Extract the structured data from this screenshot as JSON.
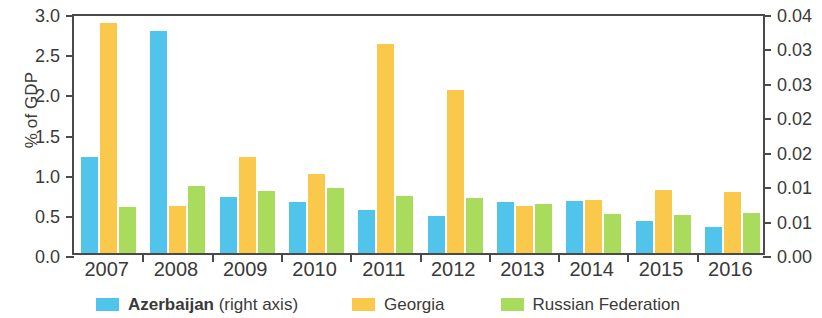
{
  "chart_data": {
    "type": "bar",
    "title": "",
    "subtitle": "",
    "xlabel": "",
    "ylabel": "% of GDP",
    "ylabel_right": "",
    "categories": [
      "2007",
      "2008",
      "2009",
      "2010",
      "2011",
      "2012",
      "2013",
      "2014",
      "2015",
      "2016"
    ],
    "series": [
      {
        "name": "Azerbaijan",
        "legend_note": "(right axis)",
        "axis": "right",
        "color": "#51c4ec",
        "values": [
          0.015,
          0.0345,
          0.0087,
          0.0079,
          0.0068,
          0.0057,
          0.008,
          0.0081,
          0.005,
          0.0041
        ],
        "left_axis_equivalent": [
          1.2,
          2.76,
          0.7,
          0.63,
          0.54,
          0.46,
          0.64,
          0.65,
          0.4,
          0.33
        ]
      },
      {
        "name": "Georgia",
        "legend_note": "",
        "axis": "left",
        "color": "#fac94b",
        "values": [
          2.86,
          0.58,
          1.2,
          0.98,
          2.6,
          2.03,
          0.59,
          0.66,
          0.78,
          0.76
        ]
      },
      {
        "name": "Russian Federation",
        "legend_note": "",
        "axis": "left",
        "color": "#a9dc5c",
        "values": [
          0.57,
          0.84,
          0.77,
          0.81,
          0.71,
          0.69,
          0.61,
          0.49,
          0.47,
          0.5
        ]
      }
    ],
    "ylim": [
      0.0,
      3.0
    ],
    "ylim_right": [
      0.0,
      0.04
    ],
    "yticks_left": [
      "0.0",
      "0.5",
      "1.0",
      "1.5",
      "2.0",
      "2.5",
      "3.0"
    ],
    "yticks_left_values": [
      0.0,
      0.5,
      1.0,
      1.5,
      2.0,
      2.5,
      3.0
    ],
    "yticks_right": [
      "0.00",
      "0.01",
      "0.01",
      "0.02",
      "0.02",
      "0.03",
      "0.03",
      "0.04"
    ],
    "yticks_right_values": [
      0.0,
      0.005,
      0.01,
      0.015,
      0.02,
      0.025,
      0.03,
      0.04
    ],
    "grid": false,
    "legend_position": "bottom"
  },
  "legend": [
    {
      "label": "Azerbaijan",
      "note": " (right axis)",
      "color": "#51c4ec",
      "key": "azerbaijan"
    },
    {
      "label": "Georgia",
      "note": "",
      "color": "#fac94b",
      "key": "georgia"
    },
    {
      "label": "Russian Federation",
      "note": "",
      "color": "#a9dc5c",
      "key": "russian-federation"
    }
  ],
  "axis": {
    "left_title": "% of GDP"
  }
}
